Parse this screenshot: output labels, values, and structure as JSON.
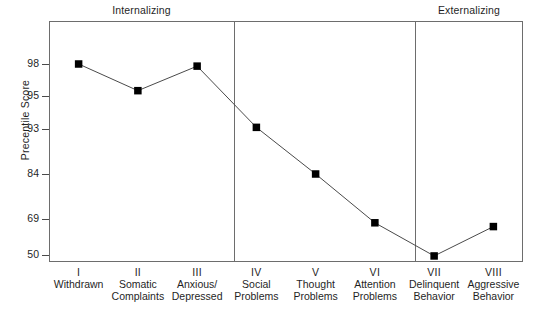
{
  "chart_data": {
    "type": "line",
    "title": "",
    "subtitle": "",
    "xlabel": "",
    "ylabel": "Precentile Score",
    "categories": [
      "I Withdrawn",
      "II Somatic Complaints",
      "III Anxious/ Depressed",
      "IV Social Problems",
      "V Thought Problems",
      "VI Attention Problems",
      "VII Delinquent Behavior",
      "VIII Aggressive Behavior"
    ],
    "values": [
      98,
      95.5,
      97.8,
      93.1,
      84,
      67,
      49.5,
      65
    ],
    "ytick_labels": [
      "98",
      "95",
      "93",
      "84",
      "69",
      "50"
    ],
    "ytick_values": [
      98,
      95,
      93,
      84,
      69,
      50
    ],
    "ylim": [
      45,
      99.5
    ],
    "grid": false,
    "legend": false,
    "marker": "square",
    "marker_color": "#000000",
    "line_color": "#4a4a4a",
    "annotations": [
      "Internalizing",
      "Externalizing"
    ],
    "group_dividers_after": [
      "III Anxious/ Depressed",
      "VI Attention Problems"
    ]
  },
  "groups": {
    "internalizing": "Internalizing",
    "externalizing": "Externalizing"
  },
  "axis": {
    "y_title": "Precentile Score",
    "y_ticks": [
      {
        "label": "98"
      },
      {
        "label": "95"
      },
      {
        "label": "93"
      },
      {
        "label": "84"
      },
      {
        "label": "69"
      },
      {
        "label": "50"
      }
    ]
  },
  "x_labels": [
    {
      "roman": "I",
      "name": "Withdrawn",
      "name2": ""
    },
    {
      "roman": "II",
      "name": "Somatic",
      "name2": "Complaints"
    },
    {
      "roman": "III",
      "name": "Anxious/",
      "name2": "Depressed"
    },
    {
      "roman": "IV",
      "name": "Social",
      "name2": "Problems"
    },
    {
      "roman": "V",
      "name": "Thought",
      "name2": "Problems"
    },
    {
      "roman": "VI",
      "name": "Attention",
      "name2": "Problems"
    },
    {
      "roman": "VII",
      "name": "Delinquent",
      "name2": "Behavior"
    },
    {
      "roman": "VIII",
      "name": "Aggressive",
      "name2": "Behavior"
    }
  ]
}
